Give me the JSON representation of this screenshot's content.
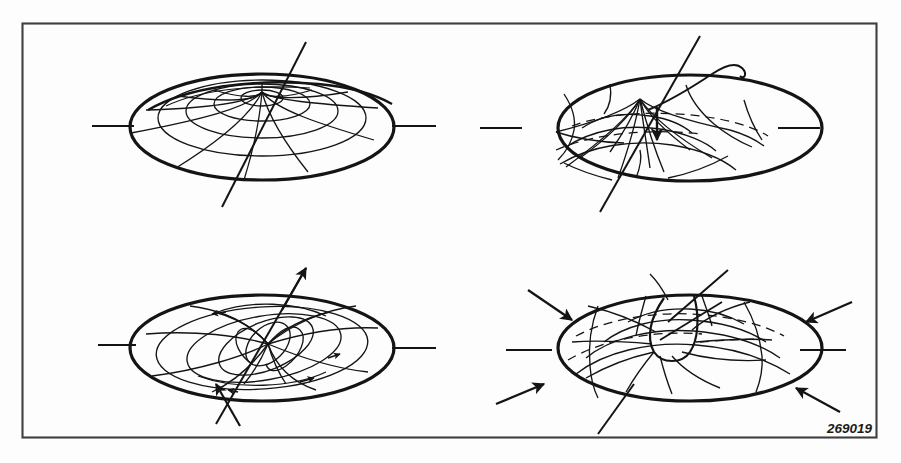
{
  "figure": {
    "part_number": "269019",
    "border_color": "#3a3a3a",
    "line_color": "#1a1a1a",
    "background_color": "#fdfdfd",
    "frame": {
      "x": 22,
      "y": 23,
      "width": 854,
      "height": 414
    },
    "panels": [
      {
        "id": "panel-top-left",
        "name": "undeformed-disk",
        "position": "top-left",
        "description": "Circular membrane polar mesh, undeformed flat disk",
        "center": [
          262,
          127
        ],
        "rim_rx": 132,
        "rim_ry": 53,
        "radial_rings": 4,
        "meridian_spokes": 12,
        "has_horizontal_axis": true,
        "has_tilted_axis": true,
        "arrows": []
      },
      {
        "id": "panel-top-right",
        "name": "conical-uplift-mode",
        "position": "top-right",
        "description": "Membrane deformed into a raised cone at centre with downward arrow indicator and wavy leader line",
        "center": [
          690,
          127
        ],
        "rim_rx": 132,
        "rim_ry": 53,
        "radial_rings": 4,
        "meridian_spokes": 12,
        "has_horizontal_axis": true,
        "has_tilted_axis": true,
        "has_wavy_leader": true,
        "arrows": [
          "down-centre"
        ]
      },
      {
        "id": "panel-bottom-left",
        "name": "torsional-twist-mode",
        "position": "bottom-left",
        "description": "Membrane in torsional twist mode with a pair of opposing shear arrows on the tilted axis",
        "center": [
          262,
          348
        ],
        "rim_rx": 132,
        "rim_ry": 53,
        "radial_rings": 4,
        "meridian_spokes": 12,
        "has_horizontal_axis": true,
        "has_tilted_axis": true,
        "arrows": [
          "shear-upper-right",
          "shear-lower-left"
        ]
      },
      {
        "id": "panel-bottom-right",
        "name": "radial-compression-dimple-mode",
        "position": "bottom-right",
        "description": "Membrane pulled into a central funnel dimple with four inward radial compression arrows at the rim",
        "center": [
          690,
          348
        ],
        "rim_rx": 132,
        "rim_ry": 53,
        "radial_rings": 4,
        "meridian_spokes": 12,
        "has_horizontal_axis": true,
        "has_tilted_axis": true,
        "has_hidden_dashed_lines": true,
        "arrows": [
          "inward-upper-left",
          "inward-upper-right",
          "inward-lower-left",
          "inward-lower-right"
        ]
      }
    ]
  }
}
